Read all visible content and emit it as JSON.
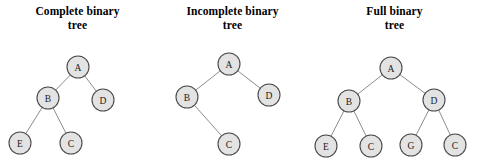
{
  "figure": {
    "caption": "",
    "background_color": "#ffffff",
    "width": 479,
    "height": 166
  },
  "style": {
    "node_fill": "#e3e3e3",
    "node_stroke": "#4a4a4a",
    "edge_color": "#8c8c8c",
    "text_color": "#000000",
    "node_radius": 11
  },
  "chart_data": {
    "type": "diagram",
    "title": "",
    "diagrams": [
      {
        "id": "complete-binary-tree",
        "title_line1": "Complete binary",
        "title_line2": "tree",
        "panel_x": 0,
        "panel_width": 155,
        "nodes": [
          {
            "id": "A",
            "label": "A",
            "cx": 78,
            "cy": 67
          },
          {
            "id": "B",
            "label": "B",
            "cx": 48,
            "cy": 98
          },
          {
            "id": "D",
            "label": "D",
            "cx": 103,
            "cy": 100
          },
          {
            "id": "E",
            "label": "E",
            "cx": 20,
            "cy": 143
          },
          {
            "id": "C",
            "label": "C",
            "cx": 71,
            "cy": 143
          }
        ],
        "edges": [
          {
            "from": "A",
            "to": "B"
          },
          {
            "from": "A",
            "to": "D"
          },
          {
            "from": "B",
            "to": "E"
          },
          {
            "from": "B",
            "to": "C"
          }
        ]
      },
      {
        "id": "incomplete-binary-tree",
        "title_line1": "Incomplete binary",
        "title_line2": "tree",
        "panel_x": 155,
        "panel_width": 155,
        "nodes": [
          {
            "id": "A",
            "label": "A",
            "cx": 229,
            "cy": 64
          },
          {
            "id": "B",
            "label": "B",
            "cx": 187,
            "cy": 97
          },
          {
            "id": "D",
            "label": "D",
            "cx": 269,
            "cy": 95
          },
          {
            "id": "C",
            "label": "C",
            "cx": 229,
            "cy": 144
          }
        ],
        "edges": [
          {
            "from": "A",
            "to": "B"
          },
          {
            "from": "A",
            "to": "D"
          },
          {
            "from": "B",
            "to": "C"
          }
        ]
      },
      {
        "id": "full-binary-tree",
        "title_line1": "Full binary",
        "title_line2": "tree",
        "panel_x": 310,
        "panel_width": 169,
        "nodes": [
          {
            "id": "A",
            "label": "A",
            "cx": 391,
            "cy": 68
          },
          {
            "id": "B",
            "label": "B",
            "cx": 349,
            "cy": 101
          },
          {
            "id": "D",
            "label": "D",
            "cx": 434,
            "cy": 100
          },
          {
            "id": "E",
            "label": "E",
            "cx": 326,
            "cy": 146
          },
          {
            "id": "C1",
            "label": "C",
            "cx": 371,
            "cy": 146
          },
          {
            "id": "G",
            "label": "G",
            "cx": 411,
            "cy": 145
          },
          {
            "id": "C2",
            "label": "C",
            "cx": 455,
            "cy": 145
          }
        ],
        "edges": [
          {
            "from": "A",
            "to": "B"
          },
          {
            "from": "A",
            "to": "D"
          },
          {
            "from": "B",
            "to": "E"
          },
          {
            "from": "B",
            "to": "C1"
          },
          {
            "from": "D",
            "to": "G"
          },
          {
            "from": "D",
            "to": "C2"
          }
        ]
      }
    ]
  }
}
